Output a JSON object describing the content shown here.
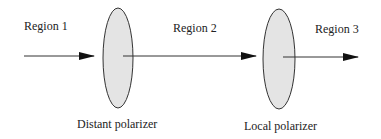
{
  "diagram": {
    "regions": [
      {
        "label": "Region 1"
      },
      {
        "label": "Region 2"
      },
      {
        "label": "Region 3"
      }
    ],
    "polarizers": [
      {
        "label": "Distant polarizer"
      },
      {
        "label": "Local polarizer"
      }
    ],
    "colors": {
      "polarizer_fill": "#e4e4e4",
      "stroke": "#333333"
    }
  }
}
